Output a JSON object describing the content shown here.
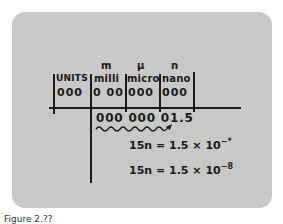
{
  "figure": {
    "caption": "Figure 2.??",
    "prefixes": [
      {
        "symbol": "m",
        "name": "milli",
        "digits": "000"
      },
      {
        "symbol": "μ",
        "name": "micro",
        "digits": "000"
      },
      {
        "symbol": "n",
        "name": "nano",
        "digits": "000"
      }
    ],
    "units": {
      "name": "UNITS",
      "digits": "000"
    },
    "milli_digits": "0 00",
    "value_row": "000 000 01.5",
    "equation_1": {
      "lhs": "15n = 1.5 × 10",
      "exp": "−*"
    },
    "equation_2": {
      "lhs": "15n = 1.5 × 10",
      "exp": "−8"
    }
  },
  "colors": {
    "card": "#c8c8c6",
    "ink": "#1a1a1a",
    "background": "#ffffff"
  }
}
